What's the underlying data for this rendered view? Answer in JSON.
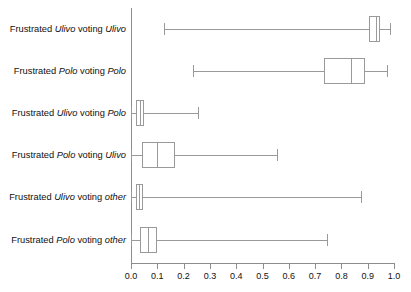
{
  "chart_data": {
    "type": "box",
    "title": "",
    "xlabel": "",
    "ylabel": "",
    "xlim": [
      0.0,
      1.0
    ],
    "grid": false,
    "legend": null,
    "orientation": "horizontal",
    "xticks": [
      "0.0",
      "0.1",
      "0.2",
      "0.3",
      "0.4",
      "0.5",
      "0.6",
      "0.7",
      "0.8",
      "0.9",
      "1.0"
    ],
    "xtick_values": [
      0.0,
      0.1,
      0.2,
      0.3,
      0.4,
      0.5,
      0.6,
      0.7,
      0.8,
      0.9,
      1.0
    ],
    "categories": [
      "Frustrated Ulivo voting Ulivo",
      "Frustrated Polo voting Polo",
      "Frustrated Ulivo voting Polo",
      "Frustrated Polo voting Ulivo",
      "Frustrated Ulivo voting other",
      "Frustrated Polo voting other"
    ],
    "boxes": [
      {
        "label_parts": [
          "Frustrated ",
          "Ulivo",
          " voting ",
          "Ulivo"
        ],
        "category": "Frustrated Ulivo voting Ulivo",
        "whisker_low": 0.125,
        "q1": 0.905,
        "median": 0.93,
        "q3": 0.947,
        "whisker_high": 0.985
      },
      {
        "label_parts": [
          "Frustrated ",
          "Polo",
          " voting ",
          "Polo"
        ],
        "category": "Frustrated Polo voting Polo",
        "whisker_low": 0.235,
        "q1": 0.735,
        "median": 0.835,
        "q3": 0.89,
        "whisker_high": 0.975
      },
      {
        "label_parts": [
          "Frustrated ",
          "Ulivo",
          " voting ",
          "Polo"
        ],
        "category": "Frustrated Ulivo voting Polo",
        "whisker_low": 0.0,
        "q1": 0.018,
        "median": 0.033,
        "q3": 0.05,
        "whisker_high": 0.255
      },
      {
        "label_parts": [
          "Frustrated ",
          "Polo",
          " voting ",
          "Ulivo"
        ],
        "category": "Frustrated Polo voting Ulivo",
        "whisker_low": 0.0,
        "q1": 0.04,
        "median": 0.098,
        "q3": 0.168,
        "whisker_high": 0.555
      },
      {
        "label_parts": [
          "Frustrated ",
          "Ulivo",
          " voting ",
          "other"
        ],
        "category": "Frustrated Ulivo voting other",
        "whisker_low": 0.0,
        "q1": 0.018,
        "median": 0.032,
        "q3": 0.045,
        "whisker_high": 0.875
      },
      {
        "label_parts": [
          "Frustrated ",
          "Polo",
          " voting ",
          "other"
        ],
        "category": "Frustrated Polo voting other",
        "whisker_low": 0.0,
        "q1": 0.035,
        "median": 0.065,
        "q3": 0.098,
        "whisker_high": 0.745
      }
    ],
    "colors": {
      "line": "#9a9a9a",
      "axis": "#8d8d8d",
      "text": "#111111",
      "background": "#ffffff"
    }
  }
}
